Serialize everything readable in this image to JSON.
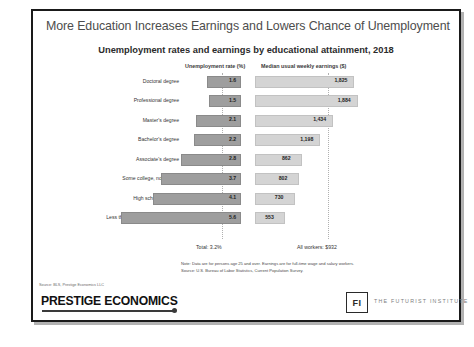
{
  "slide": {
    "title": "More Education Increases Earnings and Lowers Chance of Unemployment",
    "subtitle": "Unemployment rates and earnings by educational attainment, 2018",
    "note_line1": "Note: Data are for persons age 25 and over. Earnings are for full-time wage and salary workers.",
    "note_line2": "Source: U.S. Bureau of Labor Statistics, Current Population Survey.",
    "source": "Source: BLS, Prestige Economics LLC"
  },
  "footer": {
    "brand": "PRESTIGE ECONOMICS",
    "fi_mark": "FI",
    "fi_name": "THE FUTURIST INSTITUTE"
  },
  "annotations": {
    "total_unemployment": "Total: 3.2%",
    "all_workers_earnings": "All workers: $932"
  },
  "colors": {
    "unemployment_bar": "#9e9e9e",
    "earnings_bar": "#d4d4d4",
    "title_text": "#4d4d4d",
    "frame": "#1a1a1a"
  },
  "chart_data": {
    "type": "bar",
    "title": "Unemployment rates and earnings by educational attainment, 2018",
    "subtitle": "",
    "xlabel": "",
    "ylabel": "",
    "grid": false,
    "legend_position": "none",
    "orientation": "horizontal-bidirectional",
    "categories": [
      "Doctoral degree",
      "Professional degree",
      "Master's degree",
      "Bachelor's degree",
      "Associate's degree",
      "Some college, no degree",
      "High school diploma",
      "Less than a high school diploma"
    ],
    "series": [
      {
        "name": "Unemployment rate (%)",
        "axis_label": "Unemployment rate (%)",
        "direction": "left",
        "values": [
          1.6,
          1.5,
          2.1,
          2.2,
          2.8,
          3.7,
          4.1,
          5.6
        ],
        "value_labels": [
          "1.6",
          "1.5",
          "2.1",
          "2.2",
          "2.8",
          "3.7",
          "4.1",
          "5.6"
        ],
        "reference_value": 3.2,
        "reference_label": "Total: 3.2%"
      },
      {
        "name": "Median usual weekly earnings ($)",
        "axis_label": "Median usual weekly earnings ($)",
        "direction": "right",
        "values": [
          1825,
          1884,
          1434,
          1198,
          862,
          802,
          730,
          553
        ],
        "value_labels": [
          "1,825",
          "1,884",
          "1,434",
          "1,198",
          "862",
          "802",
          "730",
          "553"
        ],
        "reference_value": 932,
        "reference_label": "All workers: $932"
      }
    ],
    "xlim_left": [
      0,
      6.2
    ],
    "xlim_right": [
      0,
      2000
    ]
  }
}
